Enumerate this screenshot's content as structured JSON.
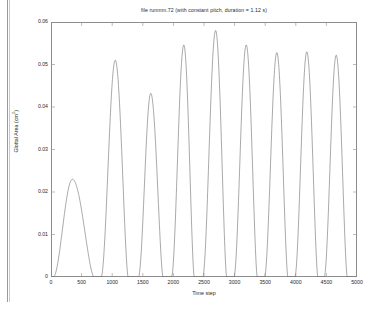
{
  "figure": {
    "title": "file runmm.72 (with constant pitch, duration = 1.12 s)",
    "background_color": "#ffffff",
    "axis_color": "#8d8d8d",
    "line_color": "#6f6f6f",
    "text_color": "#2a2a2a"
  },
  "axes": {
    "xlabel": "Time step",
    "ylabel_text": "Glottal Area (cm",
    "ylabel_sup": "2",
    "ylabel_tail": ")",
    "ylabel_full": "Glottal Area (cm2)",
    "xticks": [
      0,
      500,
      1000,
      1500,
      2000,
      2500,
      3000,
      3500,
      4000,
      4500,
      5000
    ],
    "xtick_labels": [
      "0",
      "500",
      "1000",
      "1500",
      "2000",
      "2500",
      "3000",
      "3500",
      "4000",
      "4500",
      "5000"
    ],
    "yticks": [
      0,
      0.01,
      0.02,
      0.03,
      0.04,
      0.05,
      0.06
    ],
    "ytick_labels": [
      "0",
      "0.01",
      "0.02",
      "0.03",
      "0.04",
      "0.05",
      "0.06"
    ],
    "xlim": [
      0,
      5000
    ],
    "ylim": [
      0,
      0.06
    ]
  },
  "chart_data": {
    "type": "line",
    "title": "file runmm.72 (with constant pitch, duration = 1.12 s)",
    "xlabel": "Time step",
    "ylabel": "Glottal Area (cm^2)",
    "xlim": [
      0,
      5000
    ],
    "ylim": [
      0,
      0.06
    ],
    "grid": false,
    "legend": null,
    "series": [
      {
        "name": "Glottal Area",
        "color": "#6f6f6f",
        "description": "Ten glottal-area pulses; a broad low first pulse followed by nine tall narrow pulses of roughly constant period (~500 time steps).",
        "pulses": [
          {
            "index": 1,
            "peak_x": 350,
            "peak_y": 0.023,
            "start_x": 40,
            "end_x": 700,
            "half_width": 190
          },
          {
            "index": 2,
            "peak_x": 1050,
            "peak_y": 0.051,
            "start_x": 820,
            "end_x": 1260,
            "half_width": 95
          },
          {
            "index": 3,
            "peak_x": 1630,
            "peak_y": 0.0432,
            "start_x": 1430,
            "end_x": 1830,
            "half_width": 85
          },
          {
            "index": 4,
            "peak_x": 2170,
            "peak_y": 0.0546,
            "start_x": 1970,
            "end_x": 2340,
            "half_width": 80
          },
          {
            "index": 5,
            "peak_x": 2690,
            "peak_y": 0.058,
            "start_x": 2480,
            "end_x": 2870,
            "half_width": 82
          },
          {
            "index": 6,
            "peak_x": 3190,
            "peak_y": 0.0546,
            "start_x": 2990,
            "end_x": 3370,
            "half_width": 80
          },
          {
            "index": 7,
            "peak_x": 3690,
            "peak_y": 0.0528,
            "start_x": 3490,
            "end_x": 3870,
            "half_width": 80
          },
          {
            "index": 8,
            "peak_x": 4180,
            "peak_y": 0.053,
            "start_x": 3985,
            "end_x": 4360,
            "half_width": 79
          },
          {
            "index": 9,
            "peak_x": 4660,
            "peak_y": 0.0522,
            "start_x": 4465,
            "end_x": 4840,
            "half_width": 79
          }
        ],
        "baseline": 0.0
      }
    ]
  }
}
